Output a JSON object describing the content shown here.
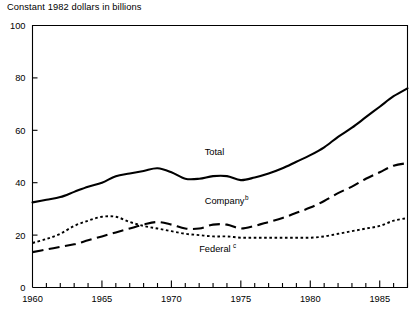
{
  "chart_data": {
    "type": "line",
    "title": "Constant 1982 dollars in billions",
    "xlabel": "",
    "ylabel": "Constant 1982 dollars in billions",
    "xlim": [
      1960,
      1987
    ],
    "ylim": [
      0,
      100
    ],
    "grid": false,
    "legend_position": "inline-annotations",
    "y_ticks": [
      0,
      20,
      40,
      60,
      80,
      100
    ],
    "y_tick_labels": [
      "0",
      "20",
      "40",
      "60",
      "80",
      "100"
    ],
    "x_ticks": [
      1960,
      1965,
      1970,
      1975,
      1980,
      1985
    ],
    "x_tick_labels": [
      "1960",
      "1965",
      "1970",
      "1975",
      "1980",
      "1985"
    ],
    "x_minor_tick_interval": 1,
    "x": [
      1960,
      1961,
      1962,
      1963,
      1964,
      1965,
      1966,
      1967,
      1968,
      1969,
      1970,
      1971,
      1972,
      1973,
      1974,
      1975,
      1976,
      1977,
      1978,
      1979,
      1980,
      1981,
      1982,
      1983,
      1984,
      1985,
      1986,
      1987
    ],
    "series": [
      {
        "name": "Total",
        "label": "Total",
        "label_superscript": "",
        "style": "solid",
        "color": "#000000",
        "line_width": 2.1,
        "values": [
          32.5,
          33.5,
          34.5,
          36.5,
          38.5,
          40.0,
          42.5,
          43.5,
          44.5,
          45.5,
          44.0,
          41.5,
          41.5,
          42.5,
          42.5,
          41.0,
          42.0,
          43.5,
          45.5,
          48.0,
          50.5,
          53.5,
          57.5,
          61.0,
          65.0,
          69.0,
          73.0,
          76.0
        ]
      },
      {
        "name": "Company",
        "label": "Company",
        "label_superscript": "b",
        "style": "dashed",
        "color": "#000000",
        "line_width": 2.1,
        "values": [
          13.5,
          14.5,
          15.5,
          16.5,
          18.0,
          19.5,
          21.0,
          22.5,
          24.0,
          25.0,
          24.0,
          22.5,
          22.5,
          24.0,
          24.0,
          22.5,
          23.5,
          25.0,
          26.5,
          28.5,
          30.5,
          33.0,
          36.0,
          38.5,
          41.5,
          44.0,
          46.5,
          47.5
        ]
      },
      {
        "name": "Federal",
        "label": "Federal",
        "label_superscript": "c",
        "style": "dotted",
        "color": "#000000",
        "line_width": 1.9,
        "values": [
          17.0,
          18.5,
          20.5,
          23.5,
          25.5,
          27.0,
          27.0,
          25.0,
          23.5,
          22.5,
          21.5,
          20.5,
          20.0,
          19.5,
          19.5,
          19.0,
          19.0,
          19.0,
          19.0,
          19.0,
          19.0,
          19.5,
          20.5,
          21.5,
          22.5,
          23.5,
          25.5,
          26.5
        ]
      }
    ],
    "annotations": [
      {
        "text": "Total",
        "x": 1972.4,
        "y": 50.5
      },
      {
        "text": "Company",
        "superscript": "b",
        "x": 1972.4,
        "y": 32.0
      },
      {
        "text": "Federal",
        "superscript": "c",
        "x": 1972.0,
        "y": 13.5
      }
    ]
  }
}
